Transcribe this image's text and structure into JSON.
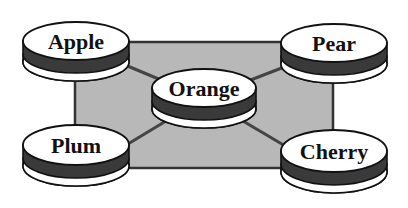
{
  "diagram": {
    "type": "hub-and-spoke",
    "background_rect": {
      "x": 75,
      "y": 42,
      "width": 258,
      "height": 126,
      "fill": "#b8b8b8",
      "stroke": "#333333"
    },
    "colors": {
      "disk_top": "#ffffff",
      "disk_band": "#3a3a3a",
      "disk_base": "#ffffff",
      "outline": "#111111",
      "connector": "#444444"
    },
    "hub": {
      "id": "orange",
      "label": "Orange",
      "cx": 204,
      "cy": 88,
      "rx": 52,
      "ry": 19
    },
    "nodes": [
      {
        "id": "apple",
        "label": "Apple",
        "cx": 76,
        "cy": 41,
        "rx": 53,
        "ry": 19
      },
      {
        "id": "pear",
        "label": "Pear",
        "cx": 334,
        "cy": 43,
        "rx": 53,
        "ry": 19
      },
      {
        "id": "plum",
        "label": "Plum",
        "cx": 76,
        "cy": 145,
        "rx": 53,
        "ry": 20
      },
      {
        "id": "cherry",
        "label": "Cherry",
        "cx": 334,
        "cy": 151,
        "rx": 53,
        "ry": 21
      }
    ],
    "edges": [
      {
        "from": "orange",
        "to": "apple"
      },
      {
        "from": "orange",
        "to": "pear"
      },
      {
        "from": "orange",
        "to": "plum"
      },
      {
        "from": "orange",
        "to": "cherry"
      }
    ]
  }
}
